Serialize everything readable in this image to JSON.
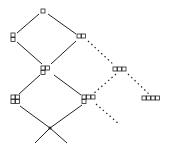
{
  "diagram": {
    "title": "",
    "colors": {
      "stroke": "#222222",
      "background": "#ffffff"
    },
    "nodes": [
      {
        "id": "n1",
        "label": "□",
        "boxes": [
          [
            0,
            0
          ]
        ],
        "x": 41,
        "y": 9
      },
      {
        "id": "n11",
        "label": "8",
        "boxes": [
          [
            0,
            0
          ],
          [
            0,
            1
          ]
        ],
        "x": 11,
        "y": 33
      },
      {
        "id": "n2",
        "label": "□□",
        "boxes": [
          [
            0,
            0
          ],
          [
            1,
            0
          ]
        ],
        "x": 77,
        "y": 34
      },
      {
        "id": "n21",
        "label": "8□",
        "boxes": [
          [
            0,
            0
          ],
          [
            0,
            1
          ],
          [
            1,
            0
          ]
        ],
        "x": 41,
        "y": 66
      },
      {
        "id": "n3",
        "label": "□□□",
        "boxes": [
          [
            0,
            0
          ],
          [
            1,
            0
          ],
          [
            2,
            0
          ]
        ],
        "x": 113,
        "y": 67
      },
      {
        "id": "n211",
        "label": "88",
        "boxes": [
          [
            0,
            0
          ],
          [
            0,
            1
          ],
          [
            1,
            0
          ],
          [
            1,
            1
          ]
        ],
        "x": 11,
        "y": 95
      },
      {
        "id": "n31",
        "label": "8□□",
        "boxes": [
          [
            0,
            0
          ],
          [
            0,
            1
          ],
          [
            1,
            0
          ],
          [
            2,
            0
          ]
        ],
        "x": 82,
        "y": 95
      },
      {
        "id": "n4",
        "label": "□□□□",
        "boxes": [
          [
            0,
            0
          ],
          [
            1,
            0
          ],
          [
            2,
            0
          ],
          [
            3,
            0
          ]
        ],
        "x": 142,
        "y": 96
      },
      {
        "id": "root",
        "label": "•",
        "dot": true,
        "x": 50,
        "y": 128
      }
    ],
    "edges": [
      {
        "from": "n1",
        "to": "n11",
        "style": "solid",
        "x1": 39,
        "y1": 14,
        "x2": 17,
        "y2": 33
      },
      {
        "from": "n1",
        "to": "n2",
        "style": "solid",
        "x1": 48,
        "y1": 14,
        "x2": 76,
        "y2": 34
      },
      {
        "from": "n11",
        "to": "n21",
        "style": "solid",
        "x1": 17,
        "y1": 42,
        "x2": 42,
        "y2": 64
      },
      {
        "from": "n2",
        "to": "n21",
        "style": "solid",
        "x1": 76,
        "y1": 41,
        "x2": 51,
        "y2": 64
      },
      {
        "from": "n2",
        "to": "n3",
        "style": "dotted",
        "x1": 88,
        "y1": 41,
        "x2": 114,
        "y2": 65
      },
      {
        "from": "n21",
        "to": "n211",
        "style": "solid",
        "x1": 40,
        "y1": 75,
        "x2": 19,
        "y2": 94
      },
      {
        "from": "n21",
        "to": "n31",
        "style": "solid",
        "x1": 54,
        "y1": 75,
        "x2": 81,
        "y2": 95
      },
      {
        "from": "n3",
        "to": "n31",
        "style": "dotted",
        "x1": 116,
        "y1": 74,
        "x2": 93,
        "y2": 94
      },
      {
        "from": "n3",
        "to": "n4",
        "style": "dotted",
        "x1": 128,
        "y1": 74,
        "x2": 150,
        "y2": 95
      },
      {
        "from": "n211",
        "to": "root",
        "style": "solid",
        "x1": 20,
        "y1": 106,
        "x2": 50,
        "y2": 128
      },
      {
        "from": "n31",
        "to": "root",
        "style": "solid",
        "x1": 82,
        "y1": 105,
        "x2": 50,
        "y2": 128
      },
      {
        "from": "root",
        "to": "out-left",
        "style": "solid",
        "x1": 50,
        "y1": 128,
        "x2": 35,
        "y2": 143
      },
      {
        "from": "root",
        "to": "out-right",
        "style": "solid",
        "x1": 50,
        "y1": 128,
        "x2": 67,
        "y2": 143
      },
      {
        "from": "n31",
        "to": "out-dotted",
        "style": "dotted",
        "x1": 96,
        "y1": 104,
        "x2": 119,
        "y2": 124
      }
    ]
  }
}
